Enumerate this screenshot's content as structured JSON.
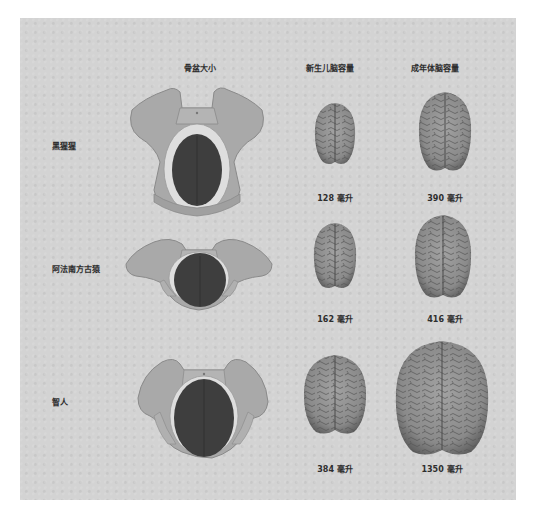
{
  "headers": {
    "pelvis": "骨盆大小",
    "newborn": "新生儿脑容量",
    "adult": "成年体脑容量"
  },
  "colors": {
    "background": "#d3d3d3",
    "bone": "#a9a9a9",
    "bone_outline": "#8a8a8a",
    "birth_canal": "#dedede",
    "infant_head": "#3e3e3e",
    "brain": "#8c8c8c",
    "brain_sulci": "#555555"
  },
  "rows": [
    {
      "species": "黑猩猩",
      "newborn_volume": "128 毫升",
      "adult_volume": "390 毫升"
    },
    {
      "species": "阿法南方古猿",
      "newborn_volume": "162 毫升",
      "adult_volume": "416 毫升"
    },
    {
      "species": "智人",
      "newborn_volume": "384 毫升",
      "adult_volume": "1350 毫升"
    }
  ]
}
